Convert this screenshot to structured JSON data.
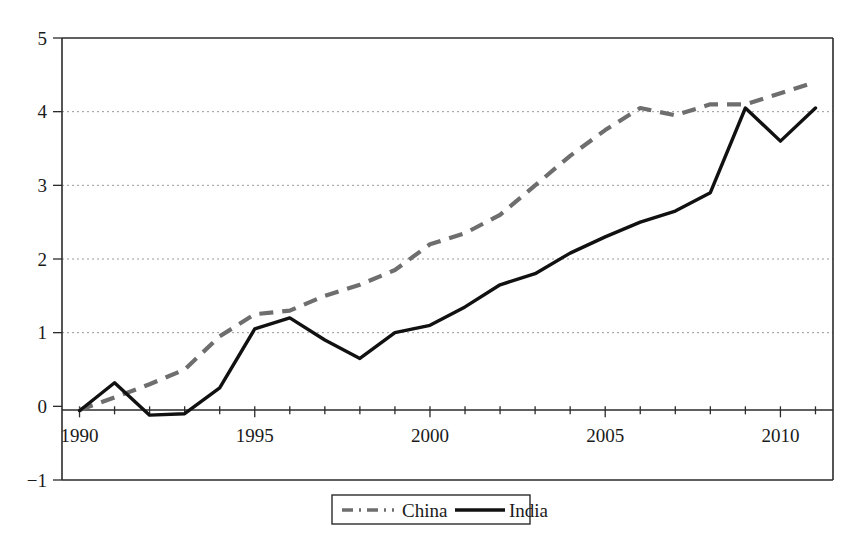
{
  "chart_data": {
    "type": "line",
    "title": "",
    "subtitle": "",
    "xlabel": "",
    "ylabel": "",
    "xlim": [
      1989.5,
      2011.5
    ],
    "ylim": [
      -1,
      5
    ],
    "grid": "horizontal-dotted-at-integers",
    "legend_position": "bottom-center",
    "y_ticks": [
      "5",
      "4",
      "3",
      "2",
      "1",
      "0",
      "−1"
    ],
    "y_tick_values": [
      5,
      4,
      3,
      2,
      1,
      0,
      -1
    ],
    "x_ticks": [
      "1990",
      "1995",
      "2000",
      "2005",
      "2010"
    ],
    "x_tick_values": [
      1990,
      1995,
      2000,
      2005,
      2010
    ],
    "x_minor_tick_interval": 1,
    "x": [
      1990,
      1991,
      1992,
      1993,
      1994,
      1995,
      1996,
      1997,
      1998,
      1999,
      2000,
      2001,
      2002,
      2003,
      2004,
      2005,
      2006,
      2007,
      2008,
      2009,
      2010,
      2011
    ],
    "series": [
      {
        "name": "China",
        "style": "dashed",
        "color": "#6e6e6e",
        "values": [
          -0.05,
          0.12,
          0.3,
          0.5,
          0.95,
          1.25,
          1.3,
          1.5,
          1.65,
          1.85,
          2.2,
          2.35,
          2.6,
          3.0,
          3.4,
          3.75,
          4.05,
          3.95,
          4.1,
          4.1,
          4.25,
          4.4
        ]
      },
      {
        "name": "India",
        "style": "solid",
        "color": "#111111",
        "values": [
          -0.06,
          0.32,
          -0.12,
          -0.1,
          0.25,
          1.05,
          1.2,
          0.9,
          0.65,
          1.0,
          1.1,
          1.35,
          1.65,
          1.8,
          2.08,
          2.3,
          2.5,
          2.65,
          2.9,
          4.05,
          3.6,
          4.05
        ]
      }
    ],
    "legend": [
      {
        "label": "China",
        "style": "dashed",
        "color": "#6e6e6e"
      },
      {
        "label": "India",
        "style": "solid",
        "color": "#111111"
      }
    ]
  },
  "colors": {
    "china": "#6e6e6e",
    "india": "#111111",
    "axis": "#2b2b2b",
    "grid": "#9a9a9a",
    "background": "#ffffff"
  }
}
